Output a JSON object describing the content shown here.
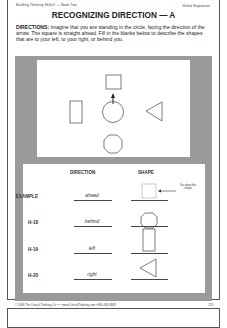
{
  "header": {
    "left": "Building Thinking Skills® — Book Two",
    "right": "Verbal Sequences"
  },
  "title": "RECOGNIZING DIRECTION — A",
  "directions": {
    "label": "DIRECTIONS:",
    "text": " Imagine that you are standing in the circle, facing the direction of the arrow. The square is straight ahead. Fill in the blanks below to describe the shapes that are to your left, to your right, or behind you."
  },
  "diagram": {
    "center": "circle-with-arrow",
    "ahead": "square",
    "left": "rectangle",
    "right": "triangle",
    "behind": "octagon"
  },
  "table": {
    "headers": {
      "direction": "DIRECTION",
      "shape": "SHAPE"
    },
    "note": "You draw this shape",
    "rows": [
      {
        "label": "EXAMPLE",
        "direction": "ahead",
        "shape": "square-dotted"
      },
      {
        "label": "H-18",
        "direction": "behind",
        "shape": "octagon"
      },
      {
        "label": "H-19",
        "direction": "left",
        "shape": "rectangle"
      },
      {
        "label": "H-20",
        "direction": "right",
        "shape": "triangle"
      }
    ]
  },
  "footer": {
    "text": "© 2006 The Critical Thinking Co.™ • www.CriticalThinking.com • 800-458-4849",
    "page": "223"
  }
}
